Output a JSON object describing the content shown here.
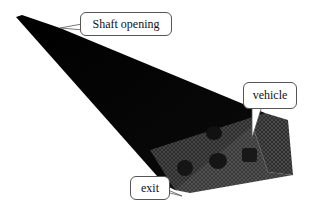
{
  "figure": {
    "colors": {
      "mesh_dark": "#0a0a0a",
      "mesh_face": "#3a3a3a",
      "vehicle": "#151515",
      "callout_border": "#555555"
    },
    "labels": {
      "shaft_opening": "Shaft opening",
      "vehicle": "vehicle",
      "exit": "exit"
    }
  }
}
